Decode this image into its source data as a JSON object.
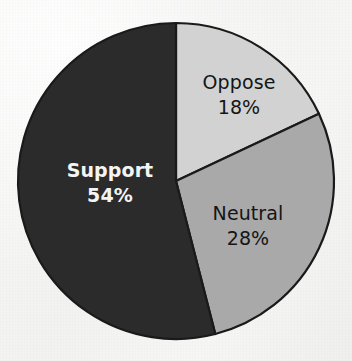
{
  "chart_data": {
    "type": "pie",
    "title": "",
    "subtitle": "",
    "xlabel": "",
    "ylabel": "",
    "legend_position": "none",
    "grid": false,
    "labels_inside_slices": true,
    "start_angle_deg_from_12oclock": 0,
    "direction": "clockwise",
    "categories": [
      "Oppose",
      "Neutral",
      "Support"
    ],
    "values": [
      18,
      28,
      54
    ],
    "value_suffix": "%",
    "slices": [
      {
        "label": "Oppose",
        "value": 18,
        "value_text": "18%",
        "color": "#d2d2d2",
        "text_color": "#151515",
        "bold": false,
        "start_deg": 0,
        "end_deg": 64.8,
        "label_x": 239,
        "label_y": 89,
        "value_x": 239,
        "value_y": 114
      },
      {
        "label": "Neutral",
        "value": 28,
        "value_text": "28%",
        "color": "#a9a9a9",
        "text_color": "#151515",
        "bold": false,
        "start_deg": 64.8,
        "end_deg": 165.6,
        "label_x": 248,
        "label_y": 220,
        "value_x": 248,
        "value_y": 245
      },
      {
        "label": "Support",
        "value": 54,
        "value_text": "54%",
        "color": "#2b2b2b",
        "text_color": "#f4f4f4",
        "bold": true,
        "start_deg": 165.6,
        "end_deg": 360,
        "label_x": 110,
        "label_y": 177,
        "value_x": 110,
        "value_y": 202
      }
    ],
    "geometry": {
      "center_x": 176,
      "center_y": 181,
      "radius": 158
    },
    "style": {
      "background_color": "#f6f6f5",
      "outline_color": "#1a1a1a",
      "outline_width": 2.2
    }
  }
}
